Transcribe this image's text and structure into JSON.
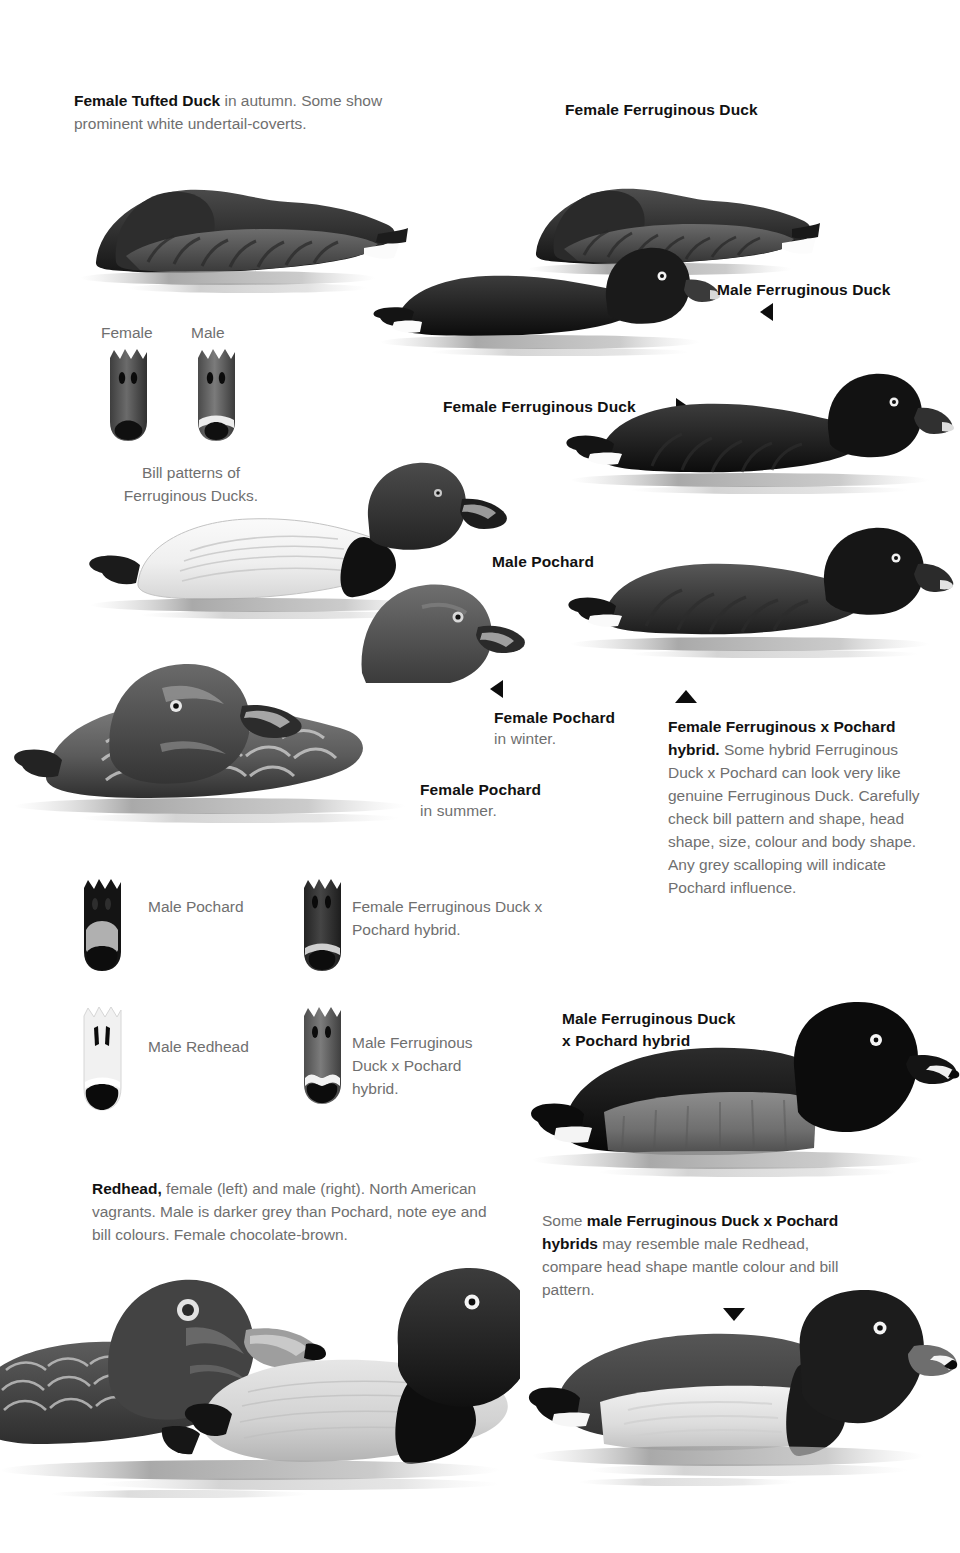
{
  "page": {
    "background": "#ffffff",
    "text_color": "#6f6f6f",
    "heading_color": "#111111"
  },
  "captions": {
    "tufted_duck": {
      "bold": "Female Tufted Duck",
      "rest": " in autumn. Some show prominent white undertail-coverts."
    },
    "female_ferruginous_top": "Female Ferruginous Duck",
    "male_ferruginous_right": "Male Ferruginous Duck",
    "female_ferruginous_mid": "Female Ferruginous Duck",
    "bill_female_label": "Female",
    "bill_male_label": "Male",
    "bill_patterns_caption": "Bill patterns of Ferruginous Ducks.",
    "male_pochard": "Male Pochard",
    "female_pochard_winter_bold": "Female Pochard",
    "female_pochard_winter_rest": "in winter.",
    "female_pochard_summer_bold": "Female Pochard",
    "female_pochard_summer_rest": "in summer.",
    "hybrid_female_block": {
      "bold": "Female Ferruginous x Pochard hybrid.",
      "rest": " Some hybrid Ferruginous Duck x Pochard can look very like genuine Ferruginous Duck. Carefully check bill pattern and shape, head shape, size, colour and body shape. Any grey scalloping will indicate Pochard influence."
    },
    "bill_male_pochard": "Male Pochard",
    "bill_female_hybrid": "Female Ferruginous Duck x Pochard hybrid.",
    "bill_male_redhead": "Male Redhead",
    "bill_male_hybrid": "Male Ferruginous Duck x Pochard hybrid.",
    "redhead_block": {
      "bold": "Redhead,",
      "rest": " female (left) and male (right). North American vagrants. Male is darker grey than Pochard, note eye and bill colours. Female chocolate-brown."
    },
    "male_hybrid_title_line1": "Male Ferruginous Duck",
    "male_hybrid_title_line2": "x Pochard hybrid",
    "male_hybrid_note": {
      "pre": "Some ",
      "bold1": "male Ferruginous Duck x Pochard hybrids",
      "post": " may resemble male Redhead, compare head shape mantle colour and bill pattern."
    }
  },
  "markers": {
    "male_ferruginous_arrow": "triangle-left",
    "female_ferruginous_arrow": "triangle-right",
    "female_pochard_arrow": "triangle-left",
    "hybrid_female_arrow": "triangle-up",
    "male_hybrid_arrow": "triangle-down"
  },
  "illustrations": [
    {
      "name": "female-tufted-duck-resting",
      "kind": "duck-sleeping"
    },
    {
      "name": "female-ferruginous-duck-resting",
      "kind": "duck-sleeping"
    },
    {
      "name": "male-ferruginous-duck-swimming-upper",
      "kind": "duck-swimming-dark"
    },
    {
      "name": "male-ferruginous-duck-swimming-right",
      "kind": "duck-swimming-dark"
    },
    {
      "name": "female-ferruginous-pochard-hybrid",
      "kind": "duck-swimming-dark"
    },
    {
      "name": "male-pochard-swimming",
      "kind": "duck-swimming-pale"
    },
    {
      "name": "female-pochard-winter",
      "kind": "duck-head"
    },
    {
      "name": "female-pochard-summer",
      "kind": "duck-swimming-brown"
    },
    {
      "name": "male-ferruginous-pochard-hybrid",
      "kind": "duck-swimming-dark-grey-mantle"
    },
    {
      "name": "female-redhead",
      "kind": "duck-swimming-brown"
    },
    {
      "name": "male-redhead",
      "kind": "duck-swimming-grey"
    },
    {
      "name": "male-hybrid-redhead-like",
      "kind": "duck-swimming-pale-mantle"
    }
  ],
  "bill_diagrams": [
    {
      "name": "bill-ferruginous-female",
      "tone": "#5f5f5f",
      "tip": "#111111"
    },
    {
      "name": "bill-ferruginous-male",
      "tone": "#6e6e6e",
      "tip": "#111111",
      "band": "#e8e8e8"
    },
    {
      "name": "bill-male-pochard",
      "tone": "#141414",
      "band": "#b4b4b4"
    },
    {
      "name": "bill-female-hybrid",
      "tone": "#3b3b3b",
      "band": "#cfcfcf"
    },
    {
      "name": "bill-male-redhead",
      "tone": "#f0f0f0",
      "tip": "#111111",
      "band": "#ffffff"
    },
    {
      "name": "bill-male-hybrid",
      "tone": "#6b6b6b",
      "tip": "#111111",
      "band": "#f2f2f2"
    }
  ]
}
